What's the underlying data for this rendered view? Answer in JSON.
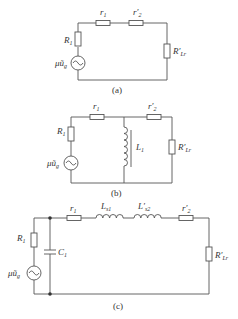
{
  "diagram": {
    "panels": [
      {
        "id": "a",
        "caption": "(a)",
        "components": {
          "source": {
            "label": "μũ",
            "sub": "g"
          },
          "R1": {
            "label": "R",
            "sub": "1"
          },
          "r1": {
            "label": "r",
            "sub": "1"
          },
          "r2p": {
            "label": "r′",
            "sub": "2"
          },
          "Rload": {
            "label": "R′",
            "sub": "Lr"
          }
        }
      },
      {
        "id": "b",
        "caption": "(b)",
        "components": {
          "source": {
            "label": "μũ",
            "sub": "g"
          },
          "R1": {
            "label": "R",
            "sub": "1"
          },
          "r1": {
            "label": "r",
            "sub": "1"
          },
          "L1": {
            "label": "L",
            "sub": "1"
          },
          "r2p": {
            "label": "r′",
            "sub": "2"
          },
          "Rload": {
            "label": "R′",
            "sub": "Lr"
          }
        }
      },
      {
        "id": "c",
        "caption": "(c)",
        "components": {
          "source": {
            "label": "μũ",
            "sub": "g"
          },
          "R1": {
            "label": "R",
            "sub": "1"
          },
          "C1": {
            "label": "C",
            "sub": "1"
          },
          "r1": {
            "label": "r",
            "sub": "1"
          },
          "Ls1": {
            "label": "L",
            "sub": "s1"
          },
          "Ls2p": {
            "label": "L′",
            "sub": "s2"
          },
          "r2p": {
            "label": "r′",
            "sub": "2"
          },
          "Rload": {
            "label": "R′",
            "sub": "Lr"
          }
        }
      }
    ]
  }
}
